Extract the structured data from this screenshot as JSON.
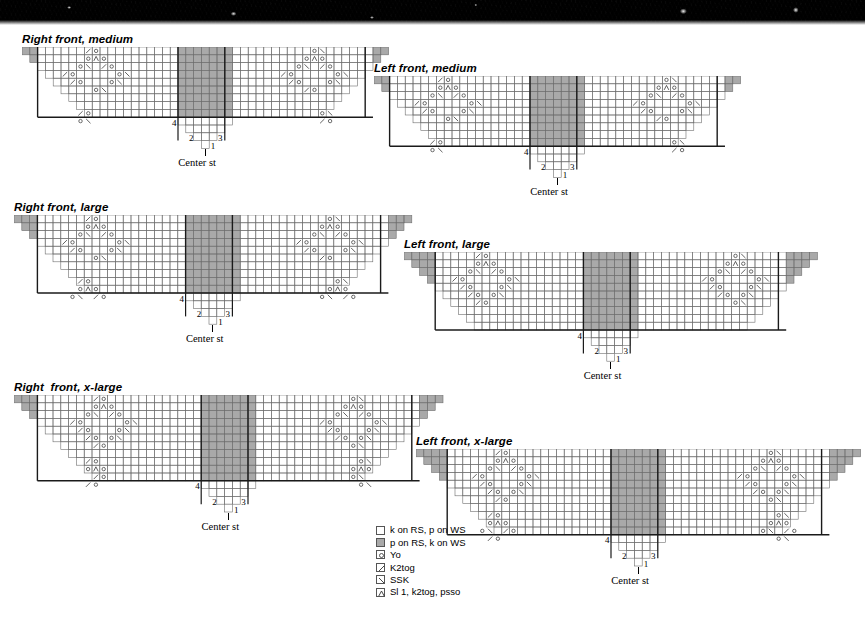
{
  "page": {
    "background_color": "#ffffff",
    "grid_line_color": "#6e6e6e",
    "heavy_line_color": "#1a1a1a",
    "purl_fill_color": "#a9a9a9",
    "knit_fill_color": "#ffffff",
    "symbol_color": "#3a3a3a",
    "cell_size": 7.8
  },
  "photo": {
    "name": "knitted-fabric-photo-strip",
    "color": "#1a1a1a"
  },
  "center_label": "Center st",
  "row_numbers": {
    "r1": "1",
    "r2": "2",
    "r3": "3",
    "r4": "4"
  },
  "symbols": {
    "knit": "",
    "purl": "",
    "yo": "o",
    "k2tog": "/",
    "ssk": "\\",
    "sl1k2togpsso": "∧"
  },
  "legend": {
    "name": "chart-legend",
    "items": [
      {
        "symbol": "knit",
        "label": "k on RS, p on WS"
      },
      {
        "symbol": "purl",
        "label": "p on RS, k on WS"
      },
      {
        "symbol": "yo",
        "label": "Yo"
      },
      {
        "symbol": "k2tog",
        "label": "K2tog"
      },
      {
        "symbol": "ssk",
        "label": "SSK"
      },
      {
        "symbol": "sl1k2togpsso",
        "label": "Sl 1, k2tog, psso"
      }
    ]
  },
  "chart_data": {
    "type": "table",
    "charts": [
      {
        "id": "right-front-medium",
        "title": "Right front, medium",
        "x": 22,
        "y": 33,
        "half_width": 23,
        "rows": 12,
        "base_offset": 1,
        "mirrored": false,
        "heavy_cols": [
          3,
          21
        ],
        "heavy_row_after": 3,
        "shelf_rows": [
          3,
          2,
          1
        ],
        "lace": [
          [
            [
              8,
              "ssk"
            ],
            [
              9,
              "yo"
            ]
          ],
          [
            [
              8,
              "yo"
            ],
            [
              9,
              "sl1k2togpsso"
            ],
            [
              10,
              "yo"
            ]
          ],
          [
            [
              7,
              "yo"
            ],
            [
              8,
              "k2tog"
            ],
            [
              10,
              "ssk"
            ],
            [
              11,
              "yo"
            ]
          ],
          [
            [
              5,
              "ssk"
            ],
            [
              6,
              "yo"
            ],
            [
              12,
              "yo"
            ],
            [
              13,
              "k2tog"
            ]
          ],
          [
            [
              6,
              "ssk"
            ],
            [
              7,
              "yo"
            ],
            [
              11,
              "yo"
            ],
            [
              12,
              "k2tog"
            ]
          ],
          [
            [
              9,
              "yo"
            ],
            [
              10,
              "k2tog"
            ]
          ],
          [],
          [],
          [
            [
              7,
              "ssk"
            ],
            [
              8,
              "yo"
            ]
          ],
          [
            [
              7,
              "yo"
            ],
            [
              8,
              "k2tog"
            ]
          ],
          [],
          []
        ]
      },
      {
        "id": "left-front-medium",
        "title": "Left front, medium",
        "x": 374,
        "y": 62,
        "half_width": 23,
        "rows": 12,
        "base_offset": 1,
        "mirrored": true,
        "heavy_cols": [
          3,
          21
        ],
        "heavy_row_after": 3,
        "shelf_rows": [
          3,
          2,
          1
        ],
        "lace": [
          [
            [
              8,
              "ssk"
            ],
            [
              9,
              "yo"
            ]
          ],
          [
            [
              8,
              "yo"
            ],
            [
              9,
              "sl1k2togpsso"
            ],
            [
              10,
              "yo"
            ]
          ],
          [
            [
              7,
              "yo"
            ],
            [
              8,
              "k2tog"
            ],
            [
              10,
              "ssk"
            ],
            [
              11,
              "yo"
            ]
          ],
          [
            [
              5,
              "ssk"
            ],
            [
              6,
              "yo"
            ],
            [
              12,
              "yo"
            ],
            [
              13,
              "k2tog"
            ]
          ],
          [
            [
              6,
              "ssk"
            ],
            [
              7,
              "yo"
            ],
            [
              11,
              "yo"
            ],
            [
              12,
              "k2tog"
            ]
          ],
          [
            [
              9,
              "yo"
            ],
            [
              10,
              "k2tog"
            ]
          ],
          [],
          [],
          [
            [
              7,
              "ssk"
            ],
            [
              8,
              "yo"
            ]
          ],
          [
            [
              7,
              "yo"
            ],
            [
              8,
              "k2tog"
            ]
          ],
          [],
          []
        ]
      },
      {
        "id": "right-front-large",
        "title": "Right front, large",
        "x": 14,
        "y": 201,
        "half_width": 25,
        "rows": 13,
        "base_offset": 1,
        "mirrored": false,
        "heavy_cols": [
          3,
          22
        ],
        "heavy_row_after": 4,
        "shelf_rows": [
          3,
          2,
          1
        ],
        "lace": [
          [
            [
              9,
              "ssk"
            ],
            [
              10,
              "yo"
            ]
          ],
          [
            [
              9,
              "yo"
            ],
            [
              10,
              "sl1k2togpsso"
            ],
            [
              11,
              "yo"
            ]
          ],
          [
            [
              8,
              "yo"
            ],
            [
              9,
              "k2tog"
            ],
            [
              11,
              "ssk"
            ],
            [
              12,
              "yo"
            ]
          ],
          [
            [
              6,
              "ssk"
            ],
            [
              7,
              "yo"
            ],
            [
              13,
              "yo"
            ],
            [
              14,
              "k2tog"
            ]
          ],
          [
            [
              7,
              "ssk"
            ],
            [
              8,
              "yo"
            ],
            [
              12,
              "yo"
            ],
            [
              13,
              "k2tog"
            ]
          ],
          [
            [
              10,
              "yo"
            ],
            [
              11,
              "k2tog"
            ]
          ],
          [],
          [],
          [
            [
              8,
              "ssk"
            ],
            [
              9,
              "yo"
            ]
          ],
          [
            [
              8,
              "yo"
            ],
            [
              9,
              "sl1k2togpsso"
            ],
            [
              10,
              "yo"
            ]
          ],
          [
            [
              7,
              "yo"
            ],
            [
              8,
              "k2tog"
            ],
            [
              10,
              "ssk"
            ],
            [
              11,
              "yo"
            ]
          ],
          [],
          []
        ]
      },
      {
        "id": "left-front-large",
        "title": "Left front, large",
        "x": 404,
        "y": 238,
        "half_width": 26,
        "rows": 13,
        "base_offset": 1,
        "mirrored": true,
        "heavy_cols": [
          3,
          22
        ],
        "heavy_row_after": 4,
        "shelf_rows": [
          3,
          2,
          1
        ],
        "lace": [
          [
            [
              9,
              "ssk"
            ],
            [
              10,
              "yo"
            ]
          ],
          [
            [
              9,
              "yo"
            ],
            [
              10,
              "sl1k2togpsso"
            ],
            [
              11,
              "yo"
            ]
          ],
          [
            [
              8,
              "yo"
            ],
            [
              9,
              "k2tog"
            ],
            [
              11,
              "ssk"
            ],
            [
              12,
              "yo"
            ]
          ],
          [
            [
              6,
              "ssk"
            ],
            [
              7,
              "yo"
            ],
            [
              13,
              "yo"
            ],
            [
              14,
              "k2tog"
            ]
          ],
          [
            [
              7,
              "ssk"
            ],
            [
              8,
              "yo"
            ],
            [
              12,
              "yo"
            ],
            [
              13,
              "k2tog"
            ]
          ],
          [
            [
              8,
              "ssk"
            ],
            [
              9,
              "yo"
            ],
            [
              11,
              "yo"
            ],
            [
              12,
              "k2tog"
            ]
          ],
          [
            [
              9,
              "ssk"
            ],
            [
              10,
              "yo"
            ]
          ],
          [],
          [],
          [],
          [],
          [],
          []
        ]
      },
      {
        "id": "right-front-xlarge",
        "title": "Right  front, x-large",
        "x": 14,
        "y": 381,
        "half_width": 27,
        "rows": 14,
        "base_offset": 1,
        "mirrored": false,
        "heavy_cols": [
          3,
          24
        ],
        "heavy_row_after": 5,
        "shelf_rows": [
          3,
          2,
          1
        ],
        "lace": [
          [
            [
              10,
              "ssk"
            ],
            [
              11,
              "yo"
            ]
          ],
          [
            [
              10,
              "yo"
            ],
            [
              11,
              "sl1k2togpsso"
            ],
            [
              12,
              "yo"
            ]
          ],
          [
            [
              9,
              "yo"
            ],
            [
              10,
              "k2tog"
            ],
            [
              12,
              "ssk"
            ],
            [
              13,
              "yo"
            ]
          ],
          [
            [
              7,
              "ssk"
            ],
            [
              8,
              "yo"
            ],
            [
              14,
              "yo"
            ],
            [
              15,
              "k2tog"
            ]
          ],
          [
            [
              8,
              "ssk"
            ],
            [
              9,
              "yo"
            ],
            [
              13,
              "yo"
            ],
            [
              14,
              "k2tog"
            ]
          ],
          [
            [
              9,
              "ssk"
            ],
            [
              10,
              "yo"
            ],
            [
              12,
              "yo"
            ],
            [
              13,
              "k2tog"
            ]
          ],
          [
            [
              10,
              "ssk"
            ],
            [
              11,
              "yo"
            ]
          ],
          [],
          [
            [
              9,
              "ssk"
            ],
            [
              10,
              "yo"
            ]
          ],
          [
            [
              9,
              "yo"
            ],
            [
              10,
              "sl1k2togpsso"
            ],
            [
              11,
              "yo"
            ]
          ],
          [
            [
              10,
              "ssk"
            ],
            [
              11,
              "yo"
            ]
          ],
          [
            [
              9,
              "ssk"
            ],
            [
              10,
              "yo"
            ]
          ],
          [],
          []
        ]
      },
      {
        "id": "left-front-xlarge",
        "title": "Left front, x-large",
        "x": 416,
        "y": 435,
        "half_width": 28,
        "rows": 14,
        "base_offset": 1,
        "mirrored": true,
        "heavy_cols": [
          3,
          24
        ],
        "heavy_row_after": 5,
        "shelf_rows": [
          3,
          2,
          1
        ],
        "lace": [
          [
            [
              10,
              "ssk"
            ],
            [
              11,
              "yo"
            ]
          ],
          [
            [
              10,
              "yo"
            ],
            [
              11,
              "sl1k2togpsso"
            ],
            [
              12,
              "yo"
            ]
          ],
          [
            [
              9,
              "yo"
            ],
            [
              10,
              "k2tog"
            ],
            [
              12,
              "ssk"
            ],
            [
              13,
              "yo"
            ]
          ],
          [
            [
              7,
              "ssk"
            ],
            [
              8,
              "yo"
            ],
            [
              14,
              "yo"
            ],
            [
              15,
              "k2tog"
            ]
          ],
          [
            [
              8,
              "ssk"
            ],
            [
              9,
              "yo"
            ],
            [
              13,
              "yo"
            ],
            [
              14,
              "k2tog"
            ]
          ],
          [
            [
              9,
              "ssk"
            ],
            [
              10,
              "yo"
            ],
            [
              12,
              "yo"
            ],
            [
              13,
              "k2tog"
            ]
          ],
          [
            [
              10,
              "ssk"
            ],
            [
              11,
              "yo"
            ]
          ],
          [],
          [
            [
              9,
              "ssk"
            ],
            [
              10,
              "yo"
            ]
          ],
          [
            [
              9,
              "yo"
            ],
            [
              10,
              "sl1k2togpsso"
            ],
            [
              11,
              "yo"
            ]
          ],
          [
            [
              8,
              "yo"
            ],
            [
              9,
              "k2tog"
            ],
            [
              11,
              "ssk"
            ],
            [
              12,
              "yo"
            ]
          ],
          [
            [
              9,
              "ssk"
            ],
            [
              10,
              "yo"
            ]
          ],
          [],
          []
        ]
      }
    ]
  }
}
